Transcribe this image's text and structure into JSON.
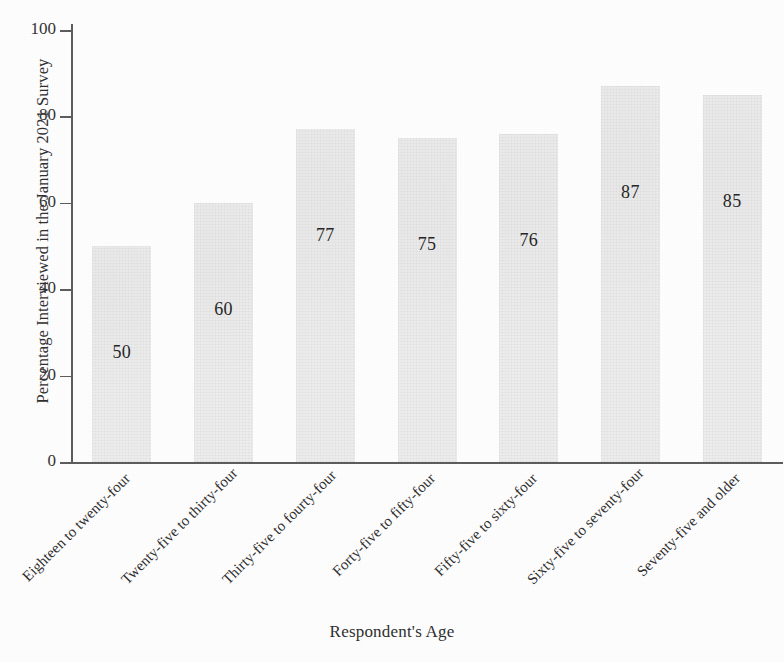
{
  "chart_data": {
    "type": "bar",
    "title": "",
    "xlabel": "Respondent's Age",
    "ylabel": "Percentage Interviewed in the January 2021 Survey",
    "categories": [
      "Eighteen to twenty-four",
      "Twenty-five to thirty-four",
      "Thirty-five to fourty-four",
      "Forty-five to fifty-four",
      "Fifty-five to sixty-four",
      "Sixty-five to seventy-four",
      "Seventy-five and older"
    ],
    "values": [
      50,
      60,
      77,
      75,
      76,
      87,
      85
    ],
    "value_labels": [
      "50",
      "60",
      "77",
      "75",
      "76",
      "87",
      "85"
    ],
    "ylim": [
      0,
      100
    ],
    "yticks": [
      0,
      20,
      40,
      60,
      80,
      100
    ],
    "ytick_labels": [
      "0",
      "20",
      "40",
      "60",
      "80",
      "100"
    ],
    "grid": false,
    "legend": null,
    "bar_color": "#ebebeb",
    "axis_color": "#5c5c5c",
    "text_color": "#2f2f2f",
    "label_rotation": -45
  }
}
